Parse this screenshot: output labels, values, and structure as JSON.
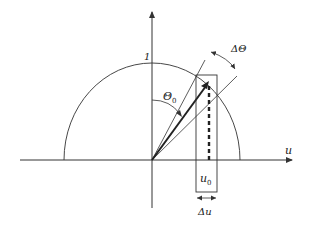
{
  "diagram": {
    "labels": {
      "axis_u": "u",
      "unit_tick": "1",
      "theta0_main": "Θ",
      "theta0_sub": "0",
      "delta_theta": "ΔΘ",
      "u0_main": "u",
      "u0_sub": "0",
      "delta_u": "Δu"
    },
    "colors": {
      "stroke": "#333333",
      "background": "#ffffff"
    }
  }
}
